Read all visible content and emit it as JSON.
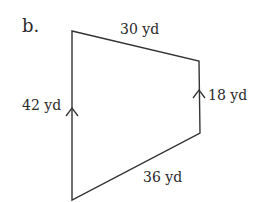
{
  "figure": {
    "part_label": "b.",
    "shape": "trapezoid",
    "sides": {
      "top": "30 yd",
      "right": "18 yd",
      "left": "42 yd",
      "bottom": "36 yd"
    },
    "parallel_marks": [
      "left",
      "right"
    ],
    "stroke_color": "#333333"
  }
}
